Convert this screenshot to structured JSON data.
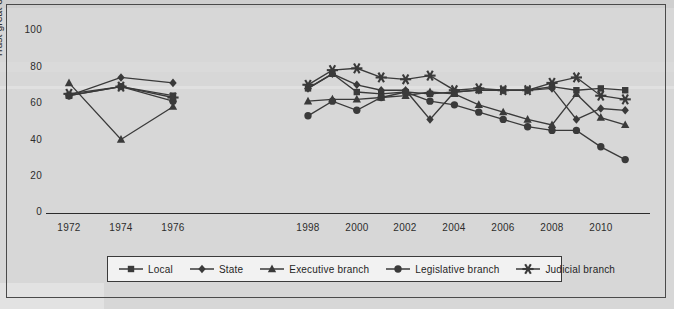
{
  "chart_data": {
    "type": "line",
    "title": "",
    "xlabel": "",
    "ylabel": "Trust great or fair",
    "ylim": [
      0,
      100
    ],
    "yticks": [
      0,
      20,
      40,
      60,
      80,
      100
    ],
    "xticks": [
      "1972",
      "1974",
      "1976",
      "1998",
      "2000",
      "2002",
      "2004",
      "2006",
      "2008",
      "2010"
    ],
    "grid": false,
    "legend_position": "bottom",
    "x_break": true,
    "series": [
      {
        "name": "Local",
        "marker": "square",
        "color": "#3a3a3a",
        "points": [
          {
            "x": 1972,
            "y": 64
          },
          {
            "x": 1974,
            "y": 69
          },
          {
            "x": 1976,
            "y": 64
          },
          {
            "x": 1998,
            "y": 68
          },
          {
            "x": 1999,
            "y": 76
          },
          {
            "x": 2000,
            "y": 66
          },
          {
            "x": 2001,
            "y": 65
          },
          {
            "x": 2002,
            "y": 66
          },
          {
            "x": 2003,
            "y": 65
          },
          {
            "x": 2004,
            "y": 66
          },
          {
            "x": 2005,
            "y": 67
          },
          {
            "x": 2006,
            "y": 67
          },
          {
            "x": 2007,
            "y": 67
          },
          {
            "x": 2008,
            "y": 69
          },
          {
            "x": 2009,
            "y": 67
          },
          {
            "x": 2010,
            "y": 68
          },
          {
            "x": 2011,
            "y": 67
          }
        ]
      },
      {
        "name": "State",
        "marker": "diamond",
        "color": "#3a3a3a",
        "points": [
          {
            "x": 1972,
            "y": 64
          },
          {
            "x": 1974,
            "y": 74
          },
          {
            "x": 1976,
            "y": 71
          },
          {
            "x": 1998,
            "y": 68
          },
          {
            "x": 1999,
            "y": 76
          },
          {
            "x": 2000,
            "y": 70
          },
          {
            "x": 2001,
            "y": 67
          },
          {
            "x": 2002,
            "y": 67
          },
          {
            "x": 2003,
            "y": 51
          },
          {
            "x": 2004,
            "y": 66
          },
          {
            "x": 2005,
            "y": 67
          },
          {
            "x": 2006,
            "y": 67
          },
          {
            "x": 2007,
            "y": 67
          },
          {
            "x": 2008,
            "y": 68
          },
          {
            "x": 2009,
            "y": 51
          },
          {
            "x": 2010,
            "y": 57
          },
          {
            "x": 2011,
            "y": 56
          }
        ]
      },
      {
        "name": "Executive branch",
        "marker": "triangle",
        "color": "#3a3a3a",
        "points": [
          {
            "x": 1972,
            "y": 71
          },
          {
            "x": 1974,
            "y": 40
          },
          {
            "x": 1976,
            "y": 58
          },
          {
            "x": 1998,
            "y": 61
          },
          {
            "x": 1999,
            "y": 62
          },
          {
            "x": 2000,
            "y": 62
          },
          {
            "x": 2001,
            "y": 63
          },
          {
            "x": 2002,
            "y": 64
          },
          {
            "x": 2003,
            "y": 66
          },
          {
            "x": 2004,
            "y": 65
          },
          {
            "x": 2005,
            "y": 59
          },
          {
            "x": 2006,
            "y": 55
          },
          {
            "x": 2007,
            "y": 51
          },
          {
            "x": 2008,
            "y": 48
          },
          {
            "x": 2009,
            "y": 65
          },
          {
            "x": 2010,
            "y": 52
          },
          {
            "x": 2011,
            "y": 48
          }
        ]
      },
      {
        "name": "Legislative branch",
        "marker": "circle",
        "color": "#3a3a3a",
        "points": [
          {
            "x": 1972,
            "y": 64
          },
          {
            "x": 1974,
            "y": 69
          },
          {
            "x": 1976,
            "y": 61
          },
          {
            "x": 1998,
            "y": 53
          },
          {
            "x": 1999,
            "y": 61
          },
          {
            "x": 2000,
            "y": 56
          },
          {
            "x": 2001,
            "y": 63
          },
          {
            "x": 2002,
            "y": 66
          },
          {
            "x": 2003,
            "y": 61
          },
          {
            "x": 2004,
            "y": 59
          },
          {
            "x": 2005,
            "y": 55
          },
          {
            "x": 2006,
            "y": 51
          },
          {
            "x": 2007,
            "y": 47
          },
          {
            "x": 2008,
            "y": 45
          },
          {
            "x": 2009,
            "y": 45
          },
          {
            "x": 2010,
            "y": 36
          },
          {
            "x": 2011,
            "y": 29
          }
        ]
      },
      {
        "name": "Judicial branch",
        "marker": "star",
        "color": "#4a4a4a",
        "points": [
          {
            "x": 1972,
            "y": 65
          },
          {
            "x": 1974,
            "y": 69
          },
          {
            "x": 1976,
            "y": 63
          },
          {
            "x": 1998,
            "y": 70
          },
          {
            "x": 1999,
            "y": 78
          },
          {
            "x": 2000,
            "y": 79
          },
          {
            "x": 2001,
            "y": 74
          },
          {
            "x": 2002,
            "y": 73
          },
          {
            "x": 2003,
            "y": 75
          },
          {
            "x": 2004,
            "y": 67
          },
          {
            "x": 2005,
            "y": 68
          },
          {
            "x": 2006,
            "y": 67
          },
          {
            "x": 2007,
            "y": 67
          },
          {
            "x": 2008,
            "y": 71
          },
          {
            "x": 2009,
            "y": 74
          },
          {
            "x": 2010,
            "y": 64
          },
          {
            "x": 2011,
            "y": 62
          }
        ]
      }
    ]
  },
  "axis": {
    "y_title": "Trust great or fair",
    "y_ticks": [
      "100",
      "80",
      "60",
      "40",
      "20",
      "0"
    ],
    "x_ticks": [
      "1972",
      "1974",
      "1976",
      "1998",
      "2000",
      "2002",
      "2004",
      "2006",
      "2008",
      "2010"
    ]
  },
  "legend": {
    "items": [
      {
        "label": "Local",
        "marker": "square"
      },
      {
        "label": "State",
        "marker": "diamond"
      },
      {
        "label": "Executive branch",
        "marker": "triangle"
      },
      {
        "label": "Legislative branch",
        "marker": "circle"
      },
      {
        "label": "Judicial branch",
        "marker": "star"
      }
    ]
  },
  "colors": {
    "page_background": "#d7d7d7",
    "frame_border": "#4a4a4a",
    "ink": "#2d2d2d",
    "legend_background": "#f2f2f2",
    "series_ink": "#3a3a3a"
  }
}
